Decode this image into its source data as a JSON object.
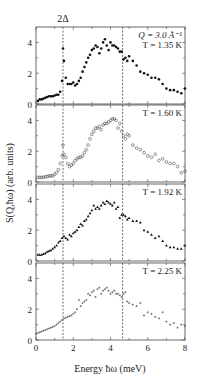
{
  "chart_data": [
    {
      "type": "scatter",
      "panel": 1,
      "annotation_q": "Q = 3.0 Å⁻¹",
      "annotation_t": "T = 1.35 K",
      "marker": "filled-circle",
      "x": [
        0.1,
        0.2,
        0.3,
        0.4,
        0.5,
        0.6,
        0.7,
        0.8,
        0.9,
        1.0,
        1.1,
        1.2,
        1.3,
        1.4,
        1.45,
        1.5,
        1.6,
        1.7,
        1.8,
        1.9,
        2.0,
        2.1,
        2.2,
        2.3,
        2.4,
        2.5,
        2.6,
        2.7,
        2.8,
        2.9,
        3.0,
        3.1,
        3.2,
        3.3,
        3.4,
        3.5,
        3.6,
        3.7,
        3.8,
        3.9,
        4.0,
        4.1,
        4.2,
        4.3,
        4.4,
        4.5,
        4.6,
        4.7,
        4.8,
        4.9,
        5.0,
        5.2,
        5.4,
        5.6,
        5.8,
        6.0,
        6.2,
        6.4,
        6.6,
        6.8,
        7.0,
        7.2,
        7.4,
        7.6,
        7.8,
        8.0
      ],
      "y": [
        0.2,
        0.3,
        0.3,
        0.35,
        0.4,
        0.45,
        0.5,
        0.5,
        0.5,
        0.55,
        0.6,
        0.6,
        0.8,
        1.5,
        3.6,
        2.8,
        1.7,
        1.3,
        1.3,
        1.3,
        1.4,
        1.2,
        1.3,
        1.5,
        1.7,
        2.1,
        2.4,
        2.7,
        3.0,
        3.2,
        3.5,
        3.6,
        3.8,
        3.7,
        3.3,
        3.6,
        4.0,
        4.2,
        3.8,
        3.5,
        4.0,
        3.8,
        3.8,
        3.7,
        3.6,
        3.4,
        3.4,
        2.9,
        3.0,
        2.8,
        3.1,
        2.8,
        2.5,
        2.1,
        2.0,
        1.9,
        1.7,
        1.7,
        1.6,
        1.3,
        1.0,
        0.9,
        0.9,
        0.8,
        0.7,
        1.0
      ],
      "ylim": [
        0,
        5
      ]
    },
    {
      "type": "scatter",
      "panel": 2,
      "annotation_t": "T = 1.60 K",
      "marker": "open-circle",
      "x": [
        0.1,
        0.2,
        0.3,
        0.4,
        0.5,
        0.6,
        0.7,
        0.8,
        0.9,
        1.0,
        1.1,
        1.2,
        1.3,
        1.4,
        1.45,
        1.5,
        1.6,
        1.7,
        1.8,
        1.9,
        2.0,
        2.1,
        2.2,
        2.3,
        2.4,
        2.5,
        2.6,
        2.7,
        2.8,
        2.9,
        3.0,
        3.1,
        3.2,
        3.3,
        3.4,
        3.5,
        3.6,
        3.7,
        3.8,
        3.9,
        4.0,
        4.1,
        4.2,
        4.3,
        4.4,
        4.5,
        4.6,
        4.7,
        4.8,
        4.9,
        5.0,
        5.2,
        5.4,
        5.6,
        5.8,
        6.0,
        6.2,
        6.4,
        6.6,
        6.8,
        7.0,
        7.2,
        7.4,
        7.6,
        7.8,
        8.0
      ],
      "y": [
        0.3,
        0.3,
        0.3,
        0.3,
        0.35,
        0.35,
        0.4,
        0.4,
        0.4,
        0.5,
        0.6,
        0.8,
        1.2,
        1.7,
        2.4,
        1.8,
        1.6,
        1.2,
        1.0,
        1.1,
        1.2,
        1.4,
        1.5,
        1.6,
        1.6,
        1.7,
        1.9,
        2.1,
        2.4,
        2.8,
        3.1,
        3.3,
        3.5,
        3.5,
        3.6,
        3.4,
        3.7,
        3.8,
        3.8,
        3.9,
        4.0,
        4.1,
        4.1,
        4.0,
        3.5,
        3.8,
        3.3,
        3.0,
        2.8,
        3.1,
        3.0,
        2.4,
        2.2,
        2.1,
        1.9,
        1.7,
        1.6,
        1.8,
        1.4,
        1.5,
        1.3,
        1.2,
        1.2,
        1.0,
        0.6,
        0.7
      ],
      "ylim": [
        0,
        5
      ]
    },
    {
      "type": "scatter",
      "panel": 3,
      "annotation_t": "T = 1.92 K",
      "marker": "filled-triangle",
      "x": [
        0.1,
        0.2,
        0.3,
        0.4,
        0.5,
        0.6,
        0.7,
        0.8,
        0.9,
        1.0,
        1.1,
        1.2,
        1.3,
        1.4,
        1.5,
        1.6,
        1.7,
        1.8,
        1.9,
        2.0,
        2.1,
        2.2,
        2.3,
        2.4,
        2.5,
        2.6,
        2.7,
        2.8,
        2.9,
        3.0,
        3.1,
        3.2,
        3.3,
        3.4,
        3.5,
        3.6,
        3.7,
        3.8,
        3.9,
        4.0,
        4.1,
        4.2,
        4.3,
        4.4,
        4.5,
        4.6,
        4.7,
        4.8,
        4.9,
        5.0,
        5.2,
        5.4,
        5.6,
        5.8,
        6.0,
        6.2,
        6.4,
        6.6,
        6.8,
        7.0,
        7.2,
        7.4,
        7.6,
        7.8,
        8.0
      ],
      "y": [
        0.4,
        0.4,
        0.4,
        0.45,
        0.5,
        0.6,
        0.65,
        0.7,
        0.8,
        0.9,
        1.0,
        1.2,
        1.3,
        1.5,
        1.6,
        1.5,
        1.4,
        1.7,
        1.6,
        1.8,
        1.9,
        2.0,
        2.2,
        2.4,
        2.3,
        2.6,
        2.7,
        2.9,
        3.1,
        3.3,
        3.6,
        3.4,
        3.5,
        3.4,
        3.6,
        3.8,
        3.7,
        3.9,
        3.8,
        3.7,
        3.6,
        3.8,
        3.4,
        3.5,
        2.8,
        3.0,
        3.0,
        2.9,
        2.7,
        2.8,
        2.6,
        2.6,
        2.5,
        2.0,
        1.9,
        1.7,
        1.5,
        1.6,
        1.3,
        1.0,
        0.9,
        0.9,
        0.8,
        0.8,
        1.0
      ],
      "ylim": [
        0,
        5
      ]
    },
    {
      "type": "scatter",
      "panel": 4,
      "annotation_t": "T = 2.25 K",
      "marker": "small-cross",
      "x": [
        0.0,
        0.1,
        0.2,
        0.3,
        0.4,
        0.5,
        0.6,
        0.7,
        0.8,
        0.9,
        1.0,
        1.1,
        1.2,
        1.3,
        1.4,
        1.5,
        1.6,
        1.7,
        1.8,
        1.9,
        2.0,
        2.1,
        2.2,
        2.3,
        2.4,
        2.5,
        2.6,
        2.7,
        2.8,
        2.9,
        3.0,
        3.1,
        3.2,
        3.3,
        3.4,
        3.5,
        3.6,
        3.7,
        3.8,
        3.9,
        4.0,
        4.1,
        4.2,
        4.3,
        4.4,
        4.5,
        4.6,
        4.7,
        4.8,
        4.9,
        5.0,
        5.2,
        5.4,
        5.6,
        5.8,
        6.0,
        6.2,
        6.4,
        6.6,
        6.8,
        7.0,
        7.2,
        7.4,
        7.6,
        7.8,
        8.0
      ],
      "y": [
        0.4,
        0.45,
        0.5,
        0.55,
        0.6,
        0.65,
        0.7,
        0.75,
        0.8,
        0.85,
        0.9,
        1.0,
        1.1,
        1.2,
        1.3,
        1.4,
        1.45,
        1.5,
        1.55,
        1.6,
        1.7,
        1.8,
        2.0,
        2.6,
        2.2,
        2.4,
        2.5,
        2.6,
        3.0,
        2.9,
        3.1,
        3.2,
        2.8,
        3.3,
        3.4,
        3.0,
        3.2,
        3.3,
        3.4,
        3.2,
        3.0,
        3.1,
        3.2,
        3.0,
        3.0,
        2.9,
        2.8,
        3.0,
        3.1,
        2.5,
        2.4,
        2.3,
        2.2,
        2.4,
        1.6,
        1.8,
        1.7,
        1.5,
        1.4,
        1.8,
        1.2,
        1.0,
        1.1,
        0.8,
        1.0,
        0.9
      ],
      "ylim": [
        0,
        5
      ]
    }
  ],
  "axes": {
    "xlabel": "Energy ħω (meV)",
    "ylabel": "S(Q,ħω) (arb. units)",
    "xlim": [
      0,
      8
    ],
    "xticks": [
      "0",
      "2",
      "4",
      "6",
      "8"
    ],
    "yticks": [
      "0",
      "2",
      "4"
    ]
  },
  "reference_lines": {
    "gap_label": "2Δ",
    "x_positions": [
      1.45,
      4.65
    ]
  }
}
